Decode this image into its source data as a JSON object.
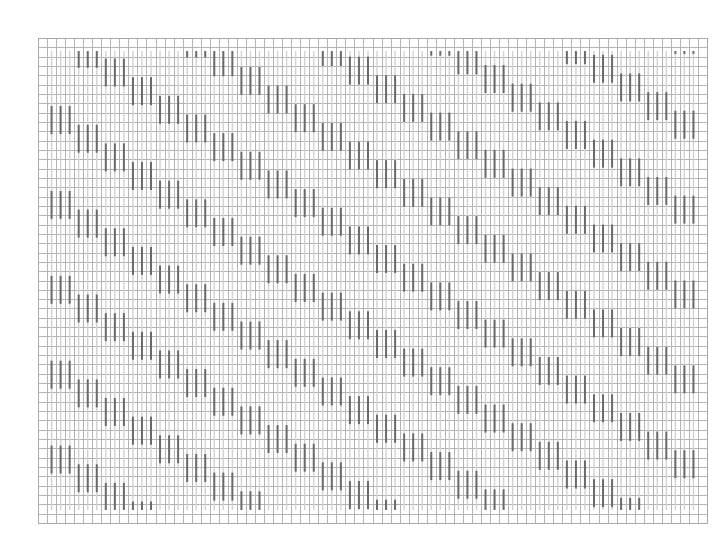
{
  "diagram": {
    "type": "stitch-chart",
    "grid": {
      "columns": 74,
      "rows": 52
    },
    "stitches": {
      "columns": 72,
      "first_column_cell": 1,
      "first_row": 1.4,
      "last_row": 50.6,
      "background_color": "#d2d2d2",
      "pattern_color": "#6a6a6a"
    },
    "pattern": {
      "description": "Diagonal staircase of dark stitch bars in groups of 3, descending to the right and repeating vertically",
      "group_width_columns": 3,
      "bar_length_rows": 3,
      "step_rows_per_group": 2,
      "vertical_period_rows": 9.1,
      "first_group_start_row": 7.3
    },
    "colors": {
      "grid": "#b4b4b4",
      "background": "#ffffff"
    }
  }
}
